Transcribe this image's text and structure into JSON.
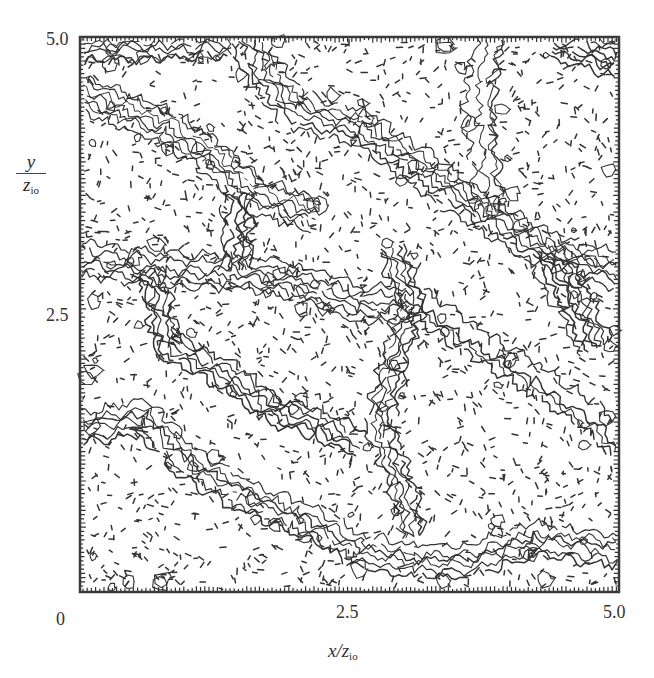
{
  "chart_data": {
    "type": "contour",
    "title": "",
    "xlabel": "x/z_io",
    "ylabel": "y/z_io",
    "xlim": [
      0,
      5.0
    ],
    "ylim": [
      0,
      5.0
    ],
    "x_ticks": [
      "0",
      "2.5",
      "5.0"
    ],
    "y_ticks": [
      "2.5",
      "5.0"
    ],
    "grid": false,
    "legend": null,
    "contour_styles": {
      "positive": "solid",
      "negative": "dashed"
    },
    "cell_boundaries": [
      [
        [
          0.0,
          4.5
        ],
        [
          0.4,
          4.35
        ],
        [
          0.8,
          4.2
        ],
        [
          1.2,
          3.95
        ],
        [
          1.6,
          3.6
        ],
        [
          2.2,
          3.4
        ]
      ],
      [
        [
          1.6,
          5.0
        ],
        [
          1.7,
          4.7
        ],
        [
          2.0,
          4.35
        ],
        [
          2.6,
          4.2
        ],
        [
          3.2,
          3.8
        ],
        [
          3.8,
          3.4
        ],
        [
          4.3,
          3.1
        ],
        [
          5.0,
          2.9
        ]
      ],
      [
        [
          3.8,
          5.0
        ],
        [
          3.7,
          4.6
        ],
        [
          3.7,
          4.2
        ],
        [
          3.8,
          3.4
        ]
      ],
      [
        [
          0.0,
          3.0
        ],
        [
          0.8,
          2.9
        ],
        [
          1.4,
          2.9
        ],
        [
          2.0,
          2.8
        ],
        [
          2.6,
          2.6
        ],
        [
          3.1,
          2.6
        ]
      ],
      [
        [
          1.5,
          3.6
        ],
        [
          1.5,
          2.9
        ]
      ],
      [
        [
          2.9,
          3.1
        ],
        [
          3.1,
          2.6
        ],
        [
          2.9,
          2.0
        ],
        [
          2.8,
          1.5
        ],
        [
          3.0,
          1.0
        ],
        [
          3.1,
          0.5
        ]
      ],
      [
        [
          0.0,
          1.5
        ],
        [
          0.6,
          1.6
        ],
        [
          1.0,
          1.2
        ],
        [
          1.5,
          0.9
        ],
        [
          2.0,
          0.7
        ],
        [
          2.6,
          0.4
        ],
        [
          3.1,
          0.3
        ],
        [
          3.6,
          0.3
        ],
        [
          4.2,
          0.5
        ],
        [
          5.0,
          0.4
        ]
      ],
      [
        [
          3.1,
          2.6
        ],
        [
          3.7,
          2.2
        ],
        [
          4.2,
          1.9
        ],
        [
          4.8,
          1.5
        ],
        [
          5.0,
          1.3
        ]
      ],
      [
        [
          4.3,
          3.1
        ],
        [
          4.6,
          2.6
        ],
        [
          4.8,
          2.2
        ]
      ],
      [
        [
          0.6,
          2.9
        ],
        [
          0.8,
          2.2
        ],
        [
          1.4,
          1.9
        ],
        [
          1.8,
          1.6
        ],
        [
          2.2,
          1.5
        ],
        [
          2.6,
          1.3
        ]
      ],
      [
        [
          0.0,
          4.9
        ],
        [
          1.4,
          4.95
        ]
      ],
      [
        [
          4.4,
          4.95
        ],
        [
          5.0,
          4.8
        ]
      ]
    ]
  },
  "axes": {
    "x_tick_labels": [
      "0",
      "2.5",
      "5.0"
    ],
    "y_tick_labels": [
      "5.0",
      "2.5"
    ],
    "x_label_main": "x/z",
    "x_label_sub": "io",
    "y_label_num": "y",
    "y_label_den": "z",
    "y_label_den_sub": "io"
  },
  "style": {
    "ink": "#333333",
    "frame": "#3a3a3a",
    "background": "#ffffff"
  }
}
